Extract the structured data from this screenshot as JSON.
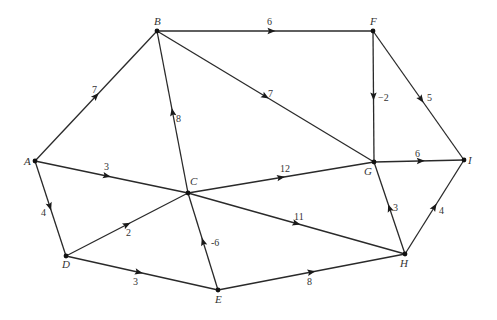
{
  "diagram": {
    "type": "directed-weighted-graph",
    "nodes": [
      {
        "id": "A",
        "label": "A",
        "x": 35,
        "y": 161,
        "lx": -11,
        "ly": 4
      },
      {
        "id": "B",
        "label": "B",
        "x": 157,
        "y": 31,
        "lx": -3,
        "ly": -6
      },
      {
        "id": "C",
        "label": "C",
        "x": 188,
        "y": 193,
        "lx": 2,
        "ly": -8
      },
      {
        "id": "D",
        "label": "D",
        "x": 66,
        "y": 256,
        "lx": -4,
        "ly": 12
      },
      {
        "id": "E",
        "label": "E",
        "x": 218,
        "y": 290,
        "lx": -3,
        "ly": 13
      },
      {
        "id": "F",
        "label": "F",
        "x": 373,
        "y": 31,
        "lx": -3,
        "ly": -6
      },
      {
        "id": "G",
        "label": "G",
        "x": 374,
        "y": 162,
        "lx": -10,
        "ly": 13
      },
      {
        "id": "H",
        "label": "H",
        "x": 405,
        "y": 254,
        "lx": -5,
        "ly": 13
      },
      {
        "id": "I",
        "label": "I",
        "x": 464,
        "y": 160,
        "lx": 4,
        "ly": 4
      }
    ],
    "edges": [
      {
        "from": "A",
        "to": "B",
        "weight": "7",
        "t": 0.5,
        "wx": 92,
        "wy": 93
      },
      {
        "from": "A",
        "to": "C",
        "weight": "3",
        "t": 0.47,
        "wx": 104,
        "wy": 170
      },
      {
        "from": "A",
        "to": "D",
        "weight": "4",
        "t": 0.48,
        "wx": 41,
        "wy": 216
      },
      {
        "from": "B",
        "to": "F",
        "weight": "6",
        "t": 0.53,
        "wx": 267,
        "wy": 25
      },
      {
        "from": "B",
        "to": "G",
        "weight": "7",
        "t": 0.5,
        "wx": 268,
        "wy": 97
      },
      {
        "from": "C",
        "to": "B",
        "weight": "8",
        "t": 0.5,
        "wx": 176,
        "wy": 122
      },
      {
        "from": "C",
        "to": "G",
        "weight": "12",
        "t": 0.5,
        "wx": 280,
        "wy": 172
      },
      {
        "from": "C",
        "to": "H",
        "weight": "11",
        "t": 0.5,
        "wx": 294,
        "wy": 220
      },
      {
        "from": "D",
        "to": "C",
        "weight": "2",
        "t": 0.5,
        "wx": 126,
        "wy": 236
      },
      {
        "from": "D",
        "to": "E",
        "weight": "3",
        "t": 0.48,
        "wx": 133,
        "wy": 285
      },
      {
        "from": "E",
        "to": "C",
        "weight": "-6",
        "t": 0.5,
        "wx": 211,
        "wy": 246
      },
      {
        "from": "E",
        "to": "H",
        "weight": "8",
        "t": 0.5,
        "wx": 307,
        "wy": 285
      },
      {
        "from": "F",
        "to": "G",
        "weight": "−2",
        "t": 0.5,
        "wx": 378,
        "wy": 101
      },
      {
        "from": "F",
        "to": "I",
        "weight": "5",
        "t": 0.53,
        "wx": 427,
        "wy": 101
      },
      {
        "from": "G",
        "to": "I",
        "weight": "6",
        "t": 0.52,
        "wx": 415,
        "wy": 157
      },
      {
        "from": "H",
        "to": "G",
        "weight": "3",
        "t": 0.5,
        "wx": 393,
        "wy": 211
      },
      {
        "from": "H",
        "to": "I",
        "weight": "4",
        "t": 0.5,
        "wx": 439,
        "wy": 214
      }
    ]
  }
}
